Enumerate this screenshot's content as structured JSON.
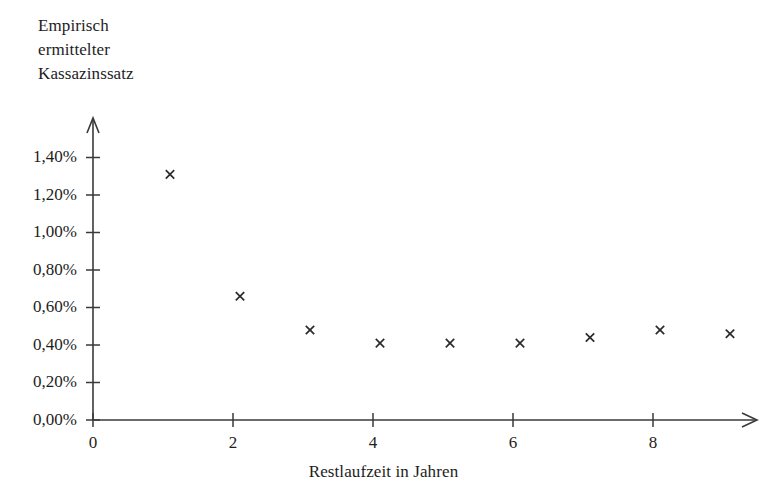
{
  "chart_data": {
    "type": "scatter",
    "title": "Empirisch\nermittelter\nKassazinssatz",
    "title_lines": [
      "Empirisch",
      "ermittelter",
      "Kassazinssatz"
    ],
    "xlabel": "Restlaufzeit in Jahren",
    "ylabel": "Empirisch ermittelter Kassazinssatz",
    "xlim": [
      0,
      9.6
    ],
    "ylim": [
      0,
      1.5
    ],
    "grid": false,
    "legend": null,
    "marker": "x",
    "marker_color": "#2b2b2b",
    "axis_color": "#3a3a3a",
    "x_ticks": [
      0,
      2,
      4,
      6,
      8
    ],
    "x_tick_labels": [
      "0",
      "2",
      "4",
      "6",
      "8"
    ],
    "y_ticks": [
      0.0,
      0.2,
      0.4,
      0.6,
      0.8,
      1.0,
      1.2,
      1.4
    ],
    "y_tick_labels": [
      "0,00%",
      "0,20%",
      "0,40%",
      "0,60%",
      "0,80%",
      "1,00%",
      "1,20%",
      "1,40%"
    ],
    "x": [
      1.1,
      2.1,
      3.1,
      4.1,
      5.1,
      6.1,
      7.1,
      8.1,
      9.1
    ],
    "values": [
      1.31,
      0.66,
      0.48,
      0.41,
      0.41,
      0.41,
      0.44,
      0.48,
      0.46
    ],
    "points": [
      {
        "x": 1.1,
        "y": 1.31
      },
      {
        "x": 2.1,
        "y": 0.66
      },
      {
        "x": 3.1,
        "y": 0.48
      },
      {
        "x": 4.1,
        "y": 0.41
      },
      {
        "x": 5.1,
        "y": 0.41
      },
      {
        "x": 6.1,
        "y": 0.41
      },
      {
        "x": 7.1,
        "y": 0.44
      },
      {
        "x": 8.1,
        "y": 0.48
      },
      {
        "x": 9.1,
        "y": 0.46
      }
    ]
  }
}
